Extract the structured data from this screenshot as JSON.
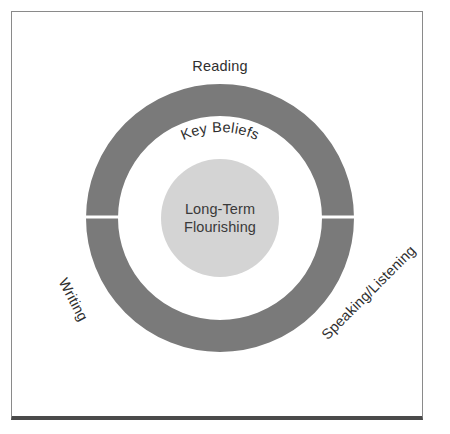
{
  "diagram": {
    "type": "concentric-circle",
    "title_visible": false,
    "colors": {
      "ring": "#7a7a7a",
      "ring_gap": "#ffffff",
      "middle_ring": "#ffffff",
      "core": "#d4d4d4",
      "ring_text": "#ffffff",
      "body_text": "#2f2f2f",
      "frame_border": "#8a8a8a",
      "frame_bottom_border": "#4a4a4a",
      "page_background": "#ffffff"
    },
    "geometry": {
      "center_x": 220,
      "center_y": 218,
      "outer_radius": 134,
      "ring_thickness": 32,
      "core_radius": 59,
      "gap_angles_deg": [
        0,
        180
      ]
    },
    "core": {
      "line1": "Long-Term",
      "line2": "Flourishing"
    },
    "middle_ring": {
      "label": "Key Beliefs"
    },
    "ring_segments": [
      {
        "name": "knowledge",
        "label": "KNOWLEDGE",
        "position": "upper-left"
      },
      {
        "name": "argument",
        "label": "ARGUMENT",
        "position": "lower-right"
      }
    ],
    "outer_labels": [
      {
        "name": "reading",
        "label": "Reading",
        "position": "top",
        "rotation_deg": 0
      },
      {
        "name": "speaking-listening",
        "label": "Speaking/Listening",
        "position": "lower-right",
        "rotation_deg": -45
      },
      {
        "name": "writing",
        "label": "Writing",
        "position": "lower-left",
        "rotation_deg": 62
      }
    ]
  }
}
